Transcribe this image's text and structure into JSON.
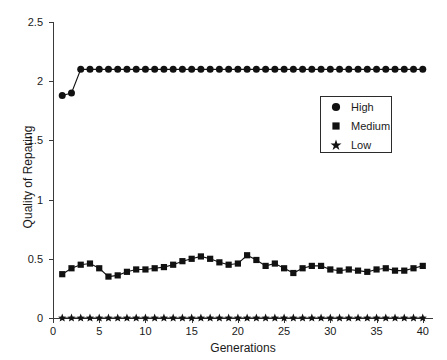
{
  "chart_data": {
    "type": "line",
    "title": "",
    "xlabel": "Generations",
    "ylabel": "Quality of Reparing",
    "xlim": [
      0,
      41
    ],
    "ylim": [
      0,
      2.5
    ],
    "grid": false,
    "legend_position": "upper-right-inside",
    "x": [
      1,
      2,
      3,
      4,
      5,
      6,
      7,
      8,
      9,
      10,
      11,
      12,
      13,
      14,
      15,
      16,
      17,
      18,
      19,
      20,
      21,
      22,
      23,
      24,
      25,
      26,
      27,
      28,
      29,
      30,
      31,
      32,
      33,
      34,
      35,
      36,
      37,
      38,
      39,
      40
    ],
    "xticks": [
      0,
      5,
      10,
      15,
      20,
      25,
      30,
      35,
      40
    ],
    "yticks": [
      0,
      0.5,
      1,
      1.5,
      2,
      2.5
    ],
    "ytick_labels": [
      "0",
      "0.5",
      "1",
      "1.5",
      "2",
      "2.5"
    ],
    "xtick_labels": [
      "0",
      "5",
      "10",
      "15",
      "20",
      "25",
      "30",
      "35",
      "40"
    ],
    "series": [
      {
        "name": "High",
        "marker": "circle",
        "color": "#111111",
        "values": [
          1.88,
          1.9,
          2.1,
          2.1,
          2.1,
          2.1,
          2.1,
          2.1,
          2.1,
          2.1,
          2.1,
          2.1,
          2.1,
          2.1,
          2.1,
          2.1,
          2.1,
          2.1,
          2.1,
          2.1,
          2.1,
          2.1,
          2.1,
          2.1,
          2.1,
          2.1,
          2.1,
          2.1,
          2.1,
          2.1,
          2.1,
          2.1,
          2.1,
          2.1,
          2.1,
          2.1,
          2.1,
          2.1,
          2.1,
          2.1
        ]
      },
      {
        "name": "Medium",
        "marker": "square",
        "color": "#111111",
        "values": [
          0.37,
          0.42,
          0.45,
          0.46,
          0.42,
          0.35,
          0.36,
          0.39,
          0.41,
          0.41,
          0.42,
          0.43,
          0.45,
          0.48,
          0.5,
          0.52,
          0.5,
          0.47,
          0.45,
          0.46,
          0.53,
          0.49,
          0.44,
          0.46,
          0.42,
          0.38,
          0.42,
          0.44,
          0.44,
          0.41,
          0.4,
          0.41,
          0.4,
          0.39,
          0.41,
          0.42,
          0.4,
          0.4,
          0.42,
          0.44
        ]
      },
      {
        "name": "Low",
        "marker": "star",
        "color": "#111111",
        "values": [
          0,
          0,
          0,
          0,
          0,
          0,
          0,
          0,
          0,
          0,
          0,
          0,
          0,
          0,
          0,
          0,
          0,
          0,
          0,
          0,
          0,
          0,
          0,
          0,
          0,
          0,
          0,
          0,
          0,
          0,
          0,
          0,
          0,
          0,
          0,
          0,
          0,
          0,
          0,
          0
        ]
      }
    ]
  },
  "legend": {
    "entries": [
      {
        "label": "High",
        "marker": "circle"
      },
      {
        "label": "Medium",
        "marker": "square"
      },
      {
        "label": "Low",
        "marker": "star"
      }
    ]
  }
}
